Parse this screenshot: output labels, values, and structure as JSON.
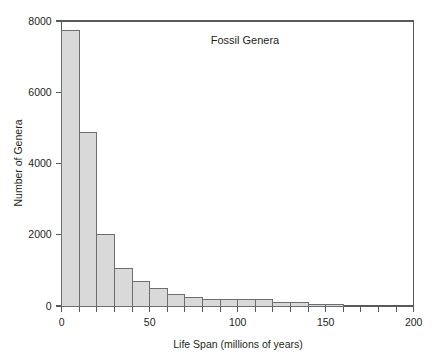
{
  "chart_data": {
    "type": "bar",
    "title": "Fossil Genera",
    "xlabel": "Life Span (millions of years)",
    "ylabel": "Number of Genera",
    "xlim": [
      0,
      200
    ],
    "ylim": [
      0,
      8000
    ],
    "grid": false,
    "legend": null,
    "bin_width": 10,
    "x_tick_labels": [
      "0",
      "50",
      "100",
      "150",
      "200"
    ],
    "x_tick_values": [
      0,
      50,
      100,
      150,
      200
    ],
    "x_minor_tick_values": [
      0,
      10,
      20,
      30,
      40,
      50,
      60,
      70,
      80,
      90,
      100,
      110,
      120,
      130,
      140,
      150,
      160,
      170,
      180,
      190,
      200
    ],
    "y_tick_labels": [
      "0",
      "2000",
      "4000",
      "6000",
      "8000"
    ],
    "y_tick_values": [
      0,
      2000,
      4000,
      6000,
      8000
    ],
    "categories": [
      "0-10",
      "10-20",
      "20-30",
      "30-40",
      "40-50",
      "50-60",
      "60-70",
      "70-80",
      "80-90",
      "90-100",
      "100-110",
      "110-120",
      "120-130",
      "130-140",
      "140-150",
      "150-160"
    ],
    "bin_starts": [
      0,
      10,
      20,
      30,
      40,
      50,
      60,
      70,
      80,
      90,
      100,
      110,
      120,
      130,
      140,
      150
    ],
    "values": [
      7740,
      4865,
      1995,
      1040,
      700,
      505,
      330,
      235,
      190,
      175,
      175,
      175,
      105,
      105,
      55,
      55
    ]
  },
  "colors": {
    "bar_fill": "#d9d9d9",
    "bar_stroke": "#6d6e71",
    "axis": "#58595b",
    "text": "#231f20",
    "background": "#ffffff"
  }
}
